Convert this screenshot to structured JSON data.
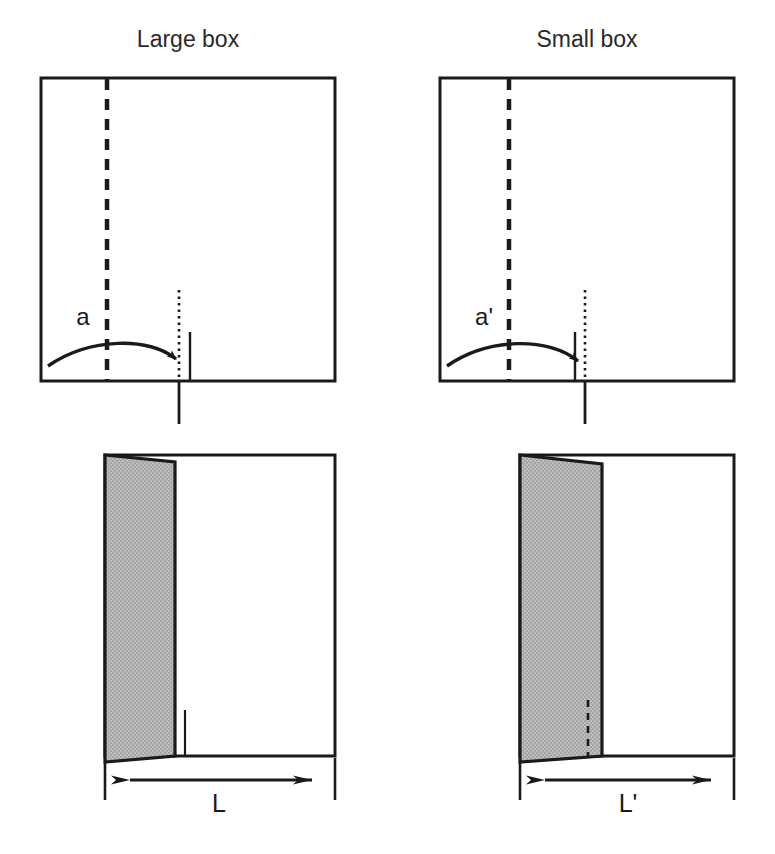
{
  "figure": {
    "title_top_left": "Large box",
    "title_top_right": "Small box",
    "background_color": "#ffffff",
    "line_color": "#1a1a1a",
    "shade_color": "#b3b3b3"
  },
  "panels": {
    "top_left": {
      "name": "Large box",
      "title": "Large box",
      "angle_label": "a",
      "view": "top view",
      "box": {
        "x": 41,
        "y": 78,
        "width": 294,
        "height": 303
      },
      "fold_line_x": 107,
      "closure_line_x": 179,
      "edge_tick_x": 190
    },
    "top_right": {
      "name": "Small box",
      "title": "Small box",
      "angle_label": "a'",
      "view": "top view",
      "box": {
        "x": 440,
        "y": 78,
        "width": 294,
        "height": 303
      },
      "fold_line_x": 509,
      "closure_line_x": 585,
      "edge_tick_x": 575
    },
    "bottom_left": {
      "name": "Large box side view",
      "dimension_label": "L",
      "view": "side view",
      "box": {
        "x": 105,
        "y": 455,
        "width": 230,
        "height": 301
      },
      "flap_width": 70,
      "dimension_from_x": 105,
      "dimension_to_x": 335,
      "dimension_y": 780,
      "inner_tick_x": 185
    },
    "bottom_right": {
      "name": "Small box side view",
      "dimension_label": "L'",
      "view": "side view",
      "box": {
        "x": 520,
        "y": 455,
        "width": 214,
        "height": 301
      },
      "flap_width": 82,
      "dimension_from_x": 520,
      "dimension_to_x": 734,
      "dimension_y": 780,
      "inner_dashed_x": 587
    }
  },
  "labels": {
    "large_box_title": "Large box",
    "small_box_title": "Small box",
    "large_angle": "a",
    "small_angle": "a'",
    "large_length": "L",
    "small_length": "L'"
  }
}
